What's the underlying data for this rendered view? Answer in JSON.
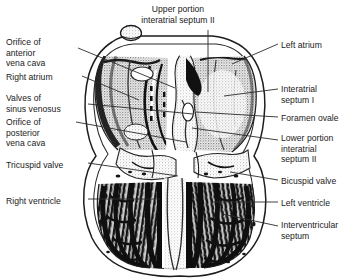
{
  "figure": {
    "title_present": false,
    "style": "black and white stippled anatomical line drawing",
    "colors": {
      "background": "#ffffff",
      "ink": "#1a1a1a",
      "leader_line": "#2b2b2b",
      "stipple_light": "#b9b9b9",
      "stipple_mid": "#7d7d7d",
      "muscle_dark": "#141414"
    }
  },
  "labels": {
    "top": [
      {
        "id": "upper-portion-interatrial-septum-ii",
        "text": "Upper portion\ninteratrial septum II",
        "x": 119,
        "y": 4,
        "width": 118
      }
    ],
    "left": [
      {
        "id": "orifice-of-anterior-vena-cava",
        "text": "Orifice of\nanterior\nvena cava",
        "x": 6,
        "y": 37,
        "width": 70
      },
      {
        "id": "right-atrium",
        "text": "Right atrium",
        "x": 6,
        "y": 72,
        "width": 70
      },
      {
        "id": "valves-of-sinus-venosus",
        "text": "Valves of\nsinus venosus",
        "x": 6,
        "y": 93,
        "width": 78
      },
      {
        "id": "orifice-of-posterior-vena-cava",
        "text": "Orifice of\nposterior\nvena cava",
        "x": 6,
        "y": 117,
        "width": 70
      },
      {
        "id": "tricuspid-valve",
        "text": "Tricuspid valve",
        "x": 6,
        "y": 160,
        "width": 80
      },
      {
        "id": "right-ventricle",
        "text": "Right ventricle",
        "x": 6,
        "y": 196,
        "width": 80
      }
    ],
    "right": [
      {
        "id": "left-atrium",
        "text": "Left atrium",
        "x": 281,
        "y": 40,
        "width": 66
      },
      {
        "id": "interatrial-septum-i",
        "text": "Interatrial\nseptum I",
        "x": 281,
        "y": 84,
        "width": 66
      },
      {
        "id": "foramen-ovale",
        "text": "Foramen ovale",
        "x": 281,
        "y": 113,
        "width": 66
      },
      {
        "id": "lower-portion-interatrial-septum-ii",
        "text": "Lower portion\ninteratrial\nseptum II",
        "x": 281,
        "y": 133,
        "width": 66
      },
      {
        "id": "bicuspid-valve",
        "text": "Bicuspid valve",
        "x": 281,
        "y": 176,
        "width": 66
      },
      {
        "id": "left-ventricle",
        "text": "Left ventricle",
        "x": 281,
        "y": 198,
        "width": 66
      },
      {
        "id": "interventricular-septum",
        "text": "Interventricular\nseptum",
        "x": 281,
        "y": 220,
        "width": 66
      }
    ]
  },
  "leader_lines": [
    {
      "id": "leader-upper-portion-interatrial-septum-ii",
      "points": "208,30 208,92"
    },
    {
      "id": "leader-orifice-of-anterior-vena-cava",
      "points": "78,48 175,88"
    },
    {
      "id": "leader-right-atrium",
      "points": "82,76 139,100"
    },
    {
      "id": "leader-valves-of-sinus-venosus",
      "points": "88,104 193,114"
    },
    {
      "id": "leader-orifice-of-posterior-vena-cava",
      "points": "76,122 186,142"
    },
    {
      "id": "leader-tricuspid-valve",
      "points": "88,163 178,176"
    },
    {
      "id": "leader-right-ventricle",
      "points": "88,199 160,199"
    },
    {
      "id": "leader-left-atrium",
      "points": "278,44 232,64"
    },
    {
      "id": "leader-interatrial-septum-i",
      "points": "278,89 224,96"
    },
    {
      "id": "leader-foramen-ovale",
      "points": "278,117 196,112"
    },
    {
      "id": "leader-lower-portion-interatrial-septum-ii",
      "points": "278,140 192,128"
    },
    {
      "id": "leader-bicuspid-valve",
      "points": "278,180 230,172"
    },
    {
      "id": "leader-left-ventricle",
      "points": "278,202 212,202"
    },
    {
      "id": "leader-interventricular-septum",
      "points": "278,226 222,214"
    }
  ]
}
